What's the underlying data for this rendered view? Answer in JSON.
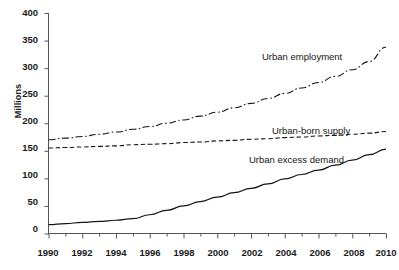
{
  "figure": {
    "ghost_title_fragment": "",
    "background_color": "#ffffff",
    "ink_color": "#1a1a1a"
  },
  "axes": {
    "ylabel": "Millions",
    "yticks": [
      "0",
      "50",
      "100",
      "150",
      "200",
      "250",
      "300",
      "350",
      "400"
    ],
    "xticks": [
      "1990",
      "1992",
      "1994",
      "1996",
      "1998",
      "2000",
      "2002",
      "2004",
      "2006",
      "2008",
      "2010"
    ]
  },
  "series_labels": {
    "urban_employment": "Urban employment",
    "urban_born_supply": "Urban-born supply",
    "urban_excess_demand": "Urban excess demand"
  },
  "chart_data": {
    "type": "line",
    "title": "",
    "xlabel": "",
    "ylabel": "Millions",
    "xlim": [
      1990,
      2010
    ],
    "ylim": [
      0,
      400
    ],
    "grid": false,
    "legend_position": "inline-annotations",
    "x": [
      1990,
      1991,
      1992,
      1993,
      1994,
      1995,
      1996,
      1997,
      1998,
      1999,
      2000,
      2001,
      2002,
      2003,
      2004,
      2005,
      2006,
      2007,
      2008,
      2009,
      2010
    ],
    "series": [
      {
        "name": "Urban employment",
        "style": "dash-dot",
        "values": [
          170,
          173,
          176,
          180,
          184,
          189,
          194,
          200,
          206,
          213,
          220,
          228,
          236,
          245,
          254,
          264,
          274,
          285,
          297,
          312,
          338
        ]
      },
      {
        "name": "Urban-born supply",
        "style": "dashed",
        "values": [
          155,
          156,
          157,
          158,
          159,
          161,
          162,
          163,
          165,
          166,
          168,
          169,
          171,
          172,
          174,
          175,
          177,
          178,
          180,
          182,
          185
        ]
      },
      {
        "name": "Urban excess demand",
        "style": "solid",
        "values": [
          16,
          18,
          20,
          22,
          24,
          27,
          34,
          42,
          50,
          58,
          66,
          74,
          82,
          90,
          99,
          107,
          115,
          124,
          133,
          143,
          153
        ]
      }
    ]
  }
}
